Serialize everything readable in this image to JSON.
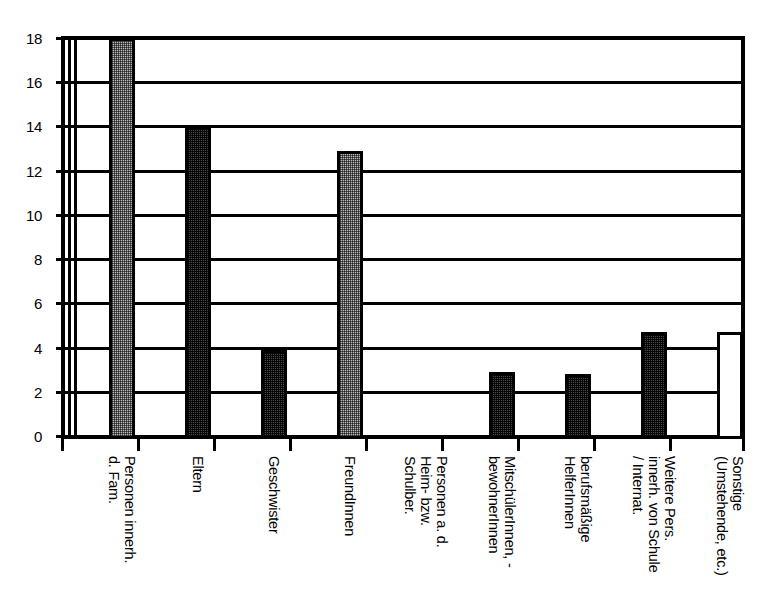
{
  "chart_data": {
    "type": "bar",
    "title": "",
    "subtitle": "",
    "xlabel": "",
    "ylabel": "",
    "ylim": [
      0,
      18
    ],
    "ytick_step": 2,
    "yticks": [
      0,
      2,
      4,
      6,
      8,
      10,
      12,
      14,
      16,
      18
    ],
    "grid": true,
    "grid_axis": "y",
    "legend": false,
    "legend_position": "none",
    "categories": [
      "Personen innerh.\nd. Fam.",
      "Eltern",
      "Geschwister",
      "FreundInnen",
      "Personen a. d.\nHeim- bzw.\nSchulber.",
      "MitschülerInnen, -\nbewohnerInnen",
      "berufsmäßige\nHelferInnen",
      "Weitere Pers.\ninnerh. von Schule\n/ Internat.",
      "Sonstige\n(Umstehende, etc.)"
    ],
    "values": [
      18,
      14,
      3.9,
      12.9,
      0,
      2.9,
      2.8,
      4.7,
      4.7
    ],
    "bar_fills": [
      "light-gray",
      "dark-gray",
      "dark-gray",
      "light-gray",
      "none",
      "dark-gray",
      "dark-gray",
      "dark-gray",
      "white"
    ],
    "colors": {
      "light_gray": "#b9b9b9",
      "dark_gray": "#4a4a4a",
      "white": "#ffffff",
      "outline": "#000000",
      "background": "#ffffff"
    }
  }
}
